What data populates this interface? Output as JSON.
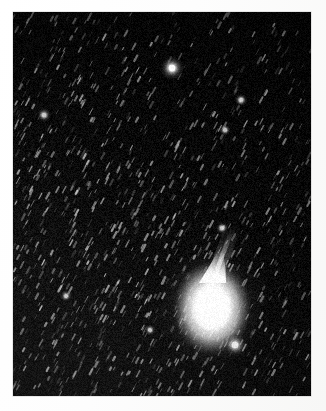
{
  "document": {
    "kind": "astronomical-photograph",
    "subject": "comet",
    "orientation": "portrait",
    "background_color": "#fdfdfc",
    "sky_color": "#050505",
    "photo_bounds": {
      "x": 13,
      "y": 12,
      "width": 298,
      "height": 384
    }
  },
  "image_content": {
    "title": "",
    "caption": "",
    "description": "Black-and-white long-exposure photograph of a bright comet in a dense star field. The comet shows a saturated teardrop-shaped coma low and right of centre with a narrow ion tail extending up and slightly to the right. Stars appear as short elongated trails running diagonally, indicating a tracked exposure.",
    "sky": {
      "base_color": "#050505",
      "glow_color": "#2a2a2a",
      "trail_angle_deg": 118,
      "trail_length_px": 5,
      "density_note": "denser toward lower-left and centre, sparser toward upper-right"
    },
    "comet": {
      "label": "comet",
      "coma": {
        "center_x": 212,
        "center_y": 308,
        "radius_x": 27,
        "radius_y": 33,
        "core_color": "#ffffff",
        "halo_color": "#e8e8e8"
      },
      "tail": {
        "label": "ion-tail",
        "from_x": 212,
        "from_y": 288,
        "to_x": 236,
        "to_y": 222,
        "width_px": 6,
        "color": "#f0f0f0"
      },
      "outer_glow": {
        "radius_x": 62,
        "radius_y": 70,
        "color": "#9a9a9a"
      }
    },
    "bright_stars": [
      {
        "name": "field-star-upper",
        "x": 172,
        "y": 68,
        "radius": 4.2,
        "brightness": "#ffffff"
      },
      {
        "name": "field-star-below-coma",
        "x": 235,
        "y": 345,
        "radius": 4.0,
        "brightness": "#f8f8f8"
      },
      {
        "name": "field-star-left",
        "x": 44,
        "y": 115,
        "radius": 2.4,
        "brightness": "#d8d8d8"
      },
      {
        "name": "field-star-mid-right",
        "x": 241,
        "y": 100,
        "radius": 2.2,
        "brightness": "#cfcfcf"
      },
      {
        "name": "field-star-upper-right",
        "x": 225,
        "y": 130,
        "radius": 2.0,
        "brightness": "#c8c8c8"
      },
      {
        "name": "field-star-lower-left",
        "x": 66,
        "y": 296,
        "radius": 2.0,
        "brightness": "#cccccc"
      },
      {
        "name": "field-star-lower-mid",
        "x": 150,
        "y": 330,
        "radius": 1.9,
        "brightness": "#c6c6c6"
      },
      {
        "name": "field-star-tail-top",
        "x": 222,
        "y": 228,
        "radius": 2.1,
        "brightness": "#d0d0d0"
      }
    ],
    "star_field": {
      "seed": 20240917,
      "count": 1500,
      "min_radius": 0.35,
      "max_radius": 1.5
    }
  }
}
